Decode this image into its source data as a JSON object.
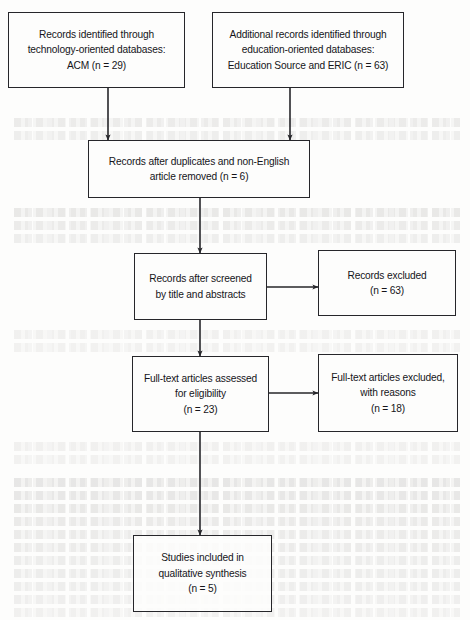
{
  "diagram": {
    "type": "flowchart",
    "stroke_color": "#26262a",
    "text_color": "#15151a",
    "background_color": "#fdfdfc",
    "nodes": [
      {
        "id": "identification-technology",
        "name": "records-identified-technology-box",
        "lines": [
          "Records identified through",
          "technology-oriented databases:",
          "ACM (n = 29)"
        ],
        "count": 29,
        "x": 8,
        "y": 12,
        "w": 177,
        "h": 76
      },
      {
        "id": "identification-education",
        "name": "records-identified-education-box",
        "lines": [
          "Additional records identified through",
          "education-oriented databases:",
          "Education Source and ERIC (n = 63)"
        ],
        "count": 63,
        "x": 212,
        "y": 12,
        "w": 192,
        "h": 76
      },
      {
        "id": "duplicates-removed",
        "name": "records-after-duplicates-box",
        "lines": [
          "Records after duplicates and non-English",
          "article removed (n = 6)"
        ],
        "count": 6,
        "x": 88,
        "y": 140,
        "w": 222,
        "h": 58
      },
      {
        "id": "screened",
        "name": "records-after-screening-box",
        "lines": [
          "Records after screened",
          "by title and abstracts"
        ],
        "x": 134,
        "y": 253,
        "w": 133,
        "h": 67
      },
      {
        "id": "records-excluded",
        "name": "records-excluded-box",
        "lines": [
          "Records excluded",
          "(n = 63)"
        ],
        "count": 63,
        "x": 318,
        "y": 250,
        "w": 138,
        "h": 66
      },
      {
        "id": "eligibility",
        "name": "full-text-assessed-box",
        "lines": [
          "Full-text articles assessed",
          "for eligibility",
          "(n = 23)"
        ],
        "count": 23,
        "x": 132,
        "y": 356,
        "w": 137,
        "h": 76
      },
      {
        "id": "full-text-excluded",
        "name": "full-text-excluded-box",
        "lines": [
          "Full-text articles excluded,",
          "with reasons",
          "(n = 18)"
        ],
        "count": 18,
        "x": 318,
        "y": 354,
        "w": 140,
        "h": 78
      },
      {
        "id": "included",
        "name": "studies-included-box",
        "lines": [
          "Studies included in",
          "qualitative synthesis",
          "(n = 5)"
        ],
        "count": 5,
        "x": 133,
        "y": 535,
        "w": 139,
        "h": 77
      }
    ],
    "connectors": [
      {
        "name": "arrow-technology-to-duplicates",
        "from": "identification-technology",
        "to": "duplicates-removed",
        "orientation": "vertical",
        "x1": 108,
        "y1": 88,
        "x2": 108,
        "y2": 140
      },
      {
        "name": "arrow-education-to-duplicates",
        "from": "identification-education",
        "to": "duplicates-removed",
        "orientation": "vertical",
        "x1": 290,
        "y1": 88,
        "x2": 290,
        "y2": 140
      },
      {
        "name": "arrow-duplicates-to-screened",
        "from": "duplicates-removed",
        "to": "screened",
        "orientation": "vertical",
        "x1": 200,
        "y1": 198,
        "x2": 200,
        "y2": 253
      },
      {
        "name": "arrow-screened-to-excluded",
        "from": "screened",
        "to": "records-excluded",
        "orientation": "horizontal",
        "x1": 267,
        "y1": 287,
        "x2": 318,
        "y2": 287
      },
      {
        "name": "arrow-screened-to-eligibility",
        "from": "screened",
        "to": "eligibility",
        "orientation": "vertical",
        "x1": 200,
        "y1": 320,
        "x2": 200,
        "y2": 356
      },
      {
        "name": "arrow-eligibility-to-fulltext-excluded",
        "from": "eligibility",
        "to": "full-text-excluded",
        "orientation": "horizontal",
        "x1": 269,
        "y1": 393,
        "x2": 318,
        "y2": 393
      },
      {
        "name": "arrow-eligibility-to-included",
        "from": "eligibility",
        "to": "included",
        "orientation": "vertical",
        "x1": 200,
        "y1": 432,
        "x2": 200,
        "y2": 535
      }
    ],
    "bleed_rows": [
      {
        "top": 118,
        "opacity": 0.3
      },
      {
        "top": 131,
        "opacity": 0.26
      },
      {
        "top": 208,
        "opacity": 0.34
      },
      {
        "top": 221,
        "opacity": 0.3
      },
      {
        "top": 234,
        "opacity": 0.26
      },
      {
        "top": 330,
        "opacity": 0.22
      },
      {
        "top": 343,
        "opacity": 0.2
      },
      {
        "top": 442,
        "opacity": 0.22
      },
      {
        "top": 455,
        "opacity": 0.2
      },
      {
        "top": 478,
        "opacity": 0.38
      },
      {
        "top": 491,
        "opacity": 0.36
      },
      {
        "top": 504,
        "opacity": 0.34
      },
      {
        "top": 517,
        "opacity": 0.32
      },
      {
        "top": 530,
        "opacity": 0.3
      },
      {
        "top": 543,
        "opacity": 0.3
      },
      {
        "top": 556,
        "opacity": 0.28
      },
      {
        "top": 569,
        "opacity": 0.28
      },
      {
        "top": 582,
        "opacity": 0.26
      },
      {
        "top": 595,
        "opacity": 0.24
      },
      {
        "top": 608,
        "opacity": 0.22
      }
    ]
  }
}
